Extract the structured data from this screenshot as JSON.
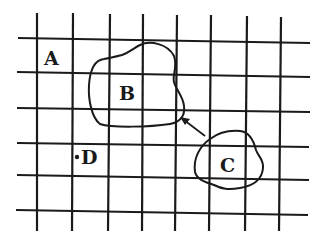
{
  "diagram": {
    "type": "grid-with-regions",
    "grid": {
      "vertical_lines_x": [
        37,
        73,
        110,
        143,
        177,
        211,
        247,
        281
      ],
      "horizontal_lines_y": [
        38,
        72,
        108,
        143,
        177,
        211
      ],
      "x_extent": [
        17,
        310
      ],
      "y_extent": [
        13,
        231
      ],
      "color": "#1a1a1a"
    },
    "labels": {
      "a": "A",
      "b": "B",
      "c": "C",
      "d": "D"
    },
    "regions": [
      {
        "id": "region-b",
        "label": "B",
        "description": "irregular closed shape"
      },
      {
        "id": "region-c",
        "label": "C",
        "description": "irregular closed shape"
      }
    ],
    "point": {
      "label": "D",
      "marker": "dot"
    },
    "arrow": {
      "from": "C",
      "to": "B",
      "direction": "up-left"
    }
  }
}
